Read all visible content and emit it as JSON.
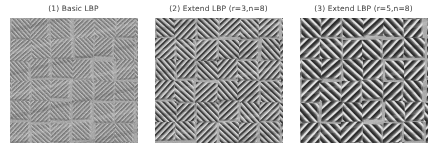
{
  "figure": {
    "width": 436,
    "height": 159,
    "background_color": "#ffffff",
    "title_color": "#3b3b3b",
    "layout": "1x3 image grid"
  },
  "panels": [
    {
      "id": "panel-1",
      "title": "(1) Basic LBP",
      "index": 1,
      "method": "Basic LBP",
      "radius": null,
      "neighbors": null,
      "image": {
        "kind": "grayscale-texture",
        "description": "LBP-filtered basket weave texture, fine low-contrast diagonal stripes",
        "stripe_period": 3.1,
        "stripe_contrast": 0.46,
        "noise_opacity": 0.5,
        "base_gray": "#9c9c9c",
        "dark_gray": "#3a3a3a",
        "light_gray": "#e2e2e2"
      }
    },
    {
      "id": "panel-2",
      "title": "(2) Extend LBP (r=3,n=8)",
      "index": 2,
      "method": "Extend LBP",
      "radius": 3,
      "neighbors": 8,
      "image": {
        "kind": "grayscale-texture",
        "description": "LBP-filtered basket weave texture, medium high-contrast diagonal stripes",
        "stripe_period": 4.4,
        "stripe_contrast": 0.82,
        "noise_opacity": 0.33,
        "base_gray": "#a2a2a2",
        "dark_gray": "#232323",
        "light_gray": "#f0f0f0"
      }
    },
    {
      "id": "panel-3",
      "title": "(3) Extend LBP (r=5,n=8)",
      "index": 3,
      "method": "Extend LBP",
      "radius": 5,
      "neighbors": 8,
      "image": {
        "kind": "grayscale-texture",
        "description": "LBP-filtered basket weave texture, coarse wide high-contrast diagonal stripes",
        "stripe_period": 6.0,
        "stripe_contrast": 0.9,
        "noise_opacity": 0.28,
        "base_gray": "#a6a6a6",
        "dark_gray": "#1e1e1e",
        "light_gray": "#f4f4f4"
      }
    }
  ]
}
